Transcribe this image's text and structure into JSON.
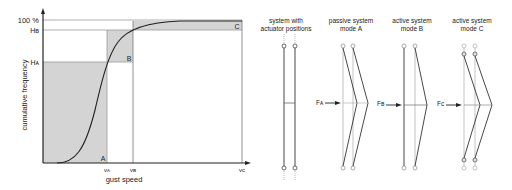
{
  "chart": {
    "ylabel": "cumulative frequency",
    "xlabel": "gust speed",
    "y_ticks": {
      "top": "100 %",
      "hb": "Hʙ",
      "ha": "Hᴀ"
    },
    "x_ticks": {
      "va": "vᴀ",
      "vb": "vʙ",
      "vc": "vᴄ"
    },
    "regions": {
      "a": "A",
      "b": "B",
      "c": "C"
    }
  },
  "panels": [
    {
      "title_line1": "system with",
      "title_line2": "actuator positions"
    },
    {
      "title_line1": "passive system",
      "title_line2": "mode A",
      "force": "Fᴀ"
    },
    {
      "title_line1": "active system",
      "title_line2": "mode B",
      "force": "Fʙ"
    },
    {
      "title_line1": "active system",
      "title_line2": "mode C",
      "force": "Fᴄ"
    }
  ],
  "colors": {
    "shade": "#d4d4d4",
    "axis": "#222222",
    "gridline": "#999999",
    "light": "#aaaaaa"
  }
}
